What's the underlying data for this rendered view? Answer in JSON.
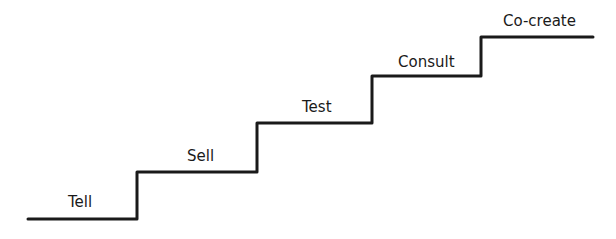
{
  "diagram": {
    "type": "staircase",
    "line_color": "#1a1a1a",
    "steps": [
      {
        "label": "Tell",
        "x1": 28,
        "x2": 137,
        "y": 219,
        "label_x": 68,
        "label_y": 193
      },
      {
        "label": "Sell",
        "x1": 137,
        "x2": 257,
        "y": 172,
        "label_x": 187,
        "label_y": 147
      },
      {
        "label": "Test",
        "x1": 257,
        "x2": 372,
        "y": 123,
        "label_x": 302,
        "label_y": 98
      },
      {
        "label": "Consult",
        "x1": 372,
        "x2": 481,
        "y": 76,
        "label_x": 398,
        "label_y": 53
      },
      {
        "label": "Co-create",
        "x1": 481,
        "x2": 593,
        "y": 37,
        "label_x": 503,
        "label_y": 12
      }
    ]
  }
}
